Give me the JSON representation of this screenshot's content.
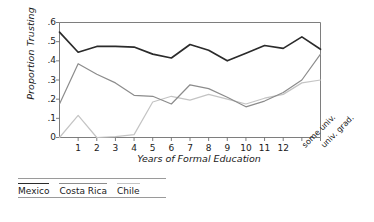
{
  "chart_data": {
    "type": "line",
    "title": "",
    "xlabel": "Years of Formal Education",
    "ylabel": "Proportion Trusting",
    "ylim": [
      0,
      0.6
    ],
    "ytick_labels": [
      "0",
      ".1",
      ".2",
      ".3",
      ".4",
      ".5",
      ".6"
    ],
    "ytick_values": [
      0,
      0.1,
      0.2,
      0.3,
      0.4,
      0.5,
      0.6
    ],
    "grid": false,
    "legend_position": "below-left",
    "x": [
      0,
      1,
      2,
      3,
      4,
      5,
      6,
      7,
      8,
      9,
      10,
      11,
      12,
      13,
      14
    ],
    "xtick_labels": [
      "1",
      "2",
      "3",
      "4",
      "5",
      "6",
      "7",
      "8",
      "9",
      "10",
      "11",
      "12",
      "some univ.",
      "univ. grad."
    ],
    "xtick_values": [
      1,
      2,
      3,
      4,
      5,
      6,
      7,
      8,
      9,
      10,
      11,
      12,
      13,
      14
    ],
    "series": [
      {
        "name": "Mexico",
        "color": "#2b2b2b",
        "values": [
          0.55,
          0.445,
          0.475,
          0.475,
          0.472,
          0.435,
          0.415,
          0.485,
          0.455,
          0.4,
          0.44,
          0.48,
          0.465,
          0.525,
          0.46
        ]
      },
      {
        "name": "Costa Rica",
        "color": "#8c8c8c",
        "values": [
          0.175,
          0.385,
          0.33,
          0.285,
          0.22,
          0.215,
          0.175,
          0.275,
          0.255,
          0.21,
          0.16,
          0.19,
          0.235,
          0.3,
          0.435
        ]
      },
      {
        "name": "Chile",
        "color": "#c4c4c4",
        "values": [
          0.0,
          0.115,
          0.0,
          0.005,
          0.015,
          0.185,
          0.215,
          0.195,
          0.225,
          0.2,
          0.175,
          0.205,
          0.225,
          0.285,
          0.3
        ]
      }
    ]
  },
  "legend": {
    "items": [
      {
        "label": "Mexico",
        "color": "#2b2b2b"
      },
      {
        "label": "Costa Rica",
        "color": "#8c8c8c"
      },
      {
        "label": "Chile",
        "color": "#c4c4c4"
      }
    ]
  }
}
